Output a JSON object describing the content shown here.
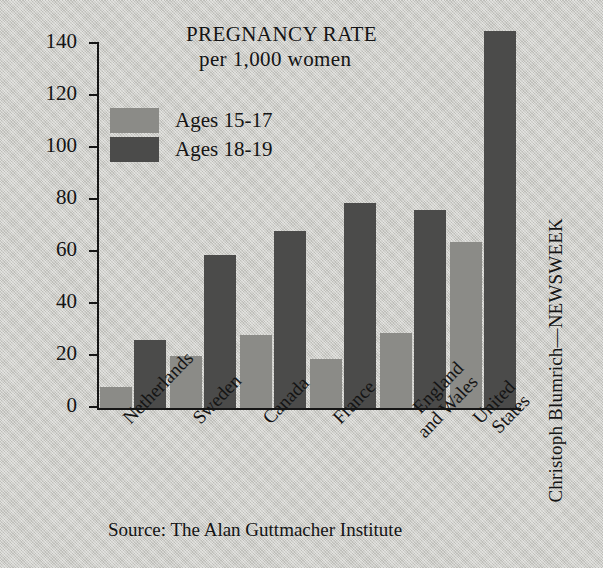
{
  "chart_data": {
    "type": "bar",
    "title": "PREGNANCY RATE",
    "subtitle": "per 1,000 women",
    "xlabel": "",
    "ylabel": "",
    "ylim": [
      0,
      140
    ],
    "ytick_step": 20,
    "yticks": [
      140,
      120,
      100,
      80,
      60,
      40,
      20,
      0
    ],
    "grid": false,
    "legend_position": "upper-left-inside",
    "categories": [
      "Netherlands",
      "Sweden",
      "Canada",
      "France",
      "England and Wales",
      "United States"
    ],
    "category_lines": [
      [
        "Netherlands"
      ],
      [
        "Sweden"
      ],
      [
        "Canada"
      ],
      [
        "France"
      ],
      [
        "England",
        "and Wales"
      ],
      [
        "United",
        "States"
      ]
    ],
    "series": [
      {
        "name": "Ages 15-17",
        "color": "#8b8b87",
        "values": [
          8,
          20,
          28,
          19,
          29,
          64
        ]
      },
      {
        "name": "Ages 18-19",
        "color": "#4b4b4a",
        "values": [
          26,
          59,
          68,
          79,
          76,
          145
        ]
      }
    ],
    "source": "Source: The Alan Guttmacher Institute",
    "credit": "Christoph Blumrich—NEWSWEEK"
  },
  "colors": {
    "background": "#cbcbc6",
    "ink": "#141414",
    "series_light": "#8b8b87",
    "series_dark": "#4b4b4a"
  }
}
